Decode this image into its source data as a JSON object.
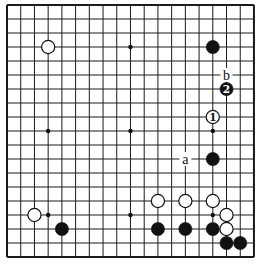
{
  "board": {
    "size": 19,
    "origin_x": 7,
    "origin_y": 5,
    "spacing_x": 13.72,
    "spacing_y": 14.0,
    "line_color": "#1a1a1a",
    "background": "#ffffff"
  },
  "star_points": [
    {
      "col": 3,
      "row": 3
    },
    {
      "col": 9,
      "row": 3
    },
    {
      "col": 15,
      "row": 3
    },
    {
      "col": 3,
      "row": 9
    },
    {
      "col": 9,
      "row": 9
    },
    {
      "col": 15,
      "row": 9
    },
    {
      "col": 3,
      "row": 15
    },
    {
      "col": 9,
      "row": 15
    },
    {
      "col": 15,
      "row": 15
    }
  ],
  "stones": [
    {
      "color": "white",
      "col": 3,
      "row": 3,
      "label": ""
    },
    {
      "color": "black",
      "col": 15,
      "row": 3,
      "label": ""
    },
    {
      "color": "black",
      "col": 16,
      "row": 6,
      "label": "2"
    },
    {
      "color": "white",
      "col": 15,
      "row": 8,
      "label": "1"
    },
    {
      "color": "black",
      "col": 15,
      "row": 11,
      "label": ""
    },
    {
      "color": "white",
      "col": 11,
      "row": 14,
      "label": ""
    },
    {
      "color": "white",
      "col": 13,
      "row": 14,
      "label": ""
    },
    {
      "color": "white",
      "col": 15,
      "row": 14,
      "label": ""
    },
    {
      "color": "white",
      "col": 2,
      "row": 15,
      "label": ""
    },
    {
      "color": "white",
      "col": 16,
      "row": 15,
      "label": ""
    },
    {
      "color": "black",
      "col": 4,
      "row": 16,
      "label": ""
    },
    {
      "color": "black",
      "col": 11,
      "row": 16,
      "label": ""
    },
    {
      "color": "black",
      "col": 13,
      "row": 16,
      "label": ""
    },
    {
      "color": "black",
      "col": 15,
      "row": 16,
      "label": ""
    },
    {
      "color": "white",
      "col": 16,
      "row": 16,
      "label": ""
    },
    {
      "color": "black",
      "col": 16,
      "row": 17,
      "label": ""
    },
    {
      "color": "black",
      "col": 17,
      "row": 17,
      "label": ""
    }
  ],
  "markers": [
    {
      "text": "b",
      "col": 16,
      "row": 5
    },
    {
      "text": "a",
      "col": 13,
      "row": 11
    }
  ]
}
